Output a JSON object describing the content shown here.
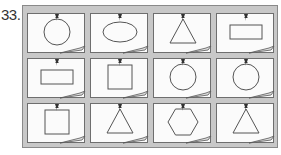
{
  "question_number": "33.",
  "grid": {
    "rows": 3,
    "cols": 4,
    "colors": {
      "board": "#c8c8c8",
      "card": "#fbfbfb",
      "stroke": "#555555",
      "pin": "#333333"
    }
  },
  "cards": [
    {
      "row": 0,
      "col": 0,
      "shape": "circle"
    },
    {
      "row": 0,
      "col": 1,
      "shape": "ellipse"
    },
    {
      "row": 0,
      "col": 2,
      "shape": "triangle"
    },
    {
      "row": 0,
      "col": 3,
      "shape": "rectangle"
    },
    {
      "row": 1,
      "col": 0,
      "shape": "rectangle"
    },
    {
      "row": 1,
      "col": 1,
      "shape": "square"
    },
    {
      "row": 1,
      "col": 2,
      "shape": "circle"
    },
    {
      "row": 1,
      "col": 3,
      "shape": "circle"
    },
    {
      "row": 2,
      "col": 0,
      "shape": "square"
    },
    {
      "row": 2,
      "col": 1,
      "shape": "triangle"
    },
    {
      "row": 2,
      "col": 2,
      "shape": "hexagon"
    },
    {
      "row": 2,
      "col": 3,
      "shape": "triangle"
    }
  ]
}
